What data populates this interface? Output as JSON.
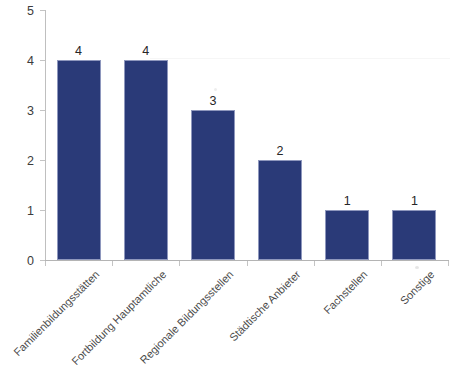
{
  "chart_data": {
    "type": "bar",
    "title": "",
    "subtitle": "",
    "xlabel": "",
    "ylabel": "",
    "categories": [
      "Familienbildungsstätten",
      "Fortbildung Hauptamtliche",
      "Regionale Bildungsstellen",
      "Städtische Anbieter",
      "Fachstellen",
      "Sonstige"
    ],
    "values": [
      4,
      4,
      3,
      2,
      1,
      1
    ],
    "data_labels": [
      "4",
      "4",
      "3",
      "2",
      "1",
      "1"
    ],
    "ylim": [
      0,
      5
    ],
    "ytick_labels": [
      "0",
      "1",
      "2",
      "3",
      "4",
      "5"
    ],
    "ytick_values": [
      0,
      1,
      2,
      3,
      4,
      5
    ],
    "grid": false,
    "legend": false,
    "legend_position": "none",
    "bar_color": "#2a3a78",
    "bar_border_color": "#8e97bd",
    "axis_color": "#bfbfbf",
    "text_color": "#3c3c3c",
    "background_color": "#ffffff",
    "category_label_rotation_deg": -45
  }
}
